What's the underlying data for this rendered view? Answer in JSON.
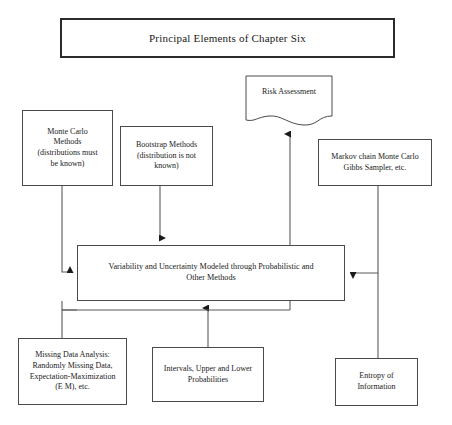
{
  "diagram": {
    "title_box": {
      "label": "Principal Elements of Chapter Six"
    },
    "nodes": {
      "risk": {
        "label": "Risk Assessment"
      },
      "monte_carlo": {
        "label": "Monte Carlo\nMethods\n(distributions must\nbe known)"
      },
      "bootstrap": {
        "label": "Bootstrap Methods\n(distribution is not\nknown)"
      },
      "markov": {
        "label": "Markov chain Monte Carlo\nGibbs Sampler, etc."
      },
      "central": {
        "label": "Variability and Uncertainty Modeled through Probabilistic and\nOther Methods"
      },
      "missing_data": {
        "label": "Missing Data Analysis:\nRandomly Missing Data,\nExpectation-Maximization\n(E M), etc."
      },
      "intervals": {
        "label": "Intervals, Upper and Lower\nProbabilities"
      },
      "entropy": {
        "label": "Entropy of\nInformation"
      }
    },
    "colors": {
      "stroke": "#4a4a4a",
      "title_stroke": "#2b2b2b",
      "connector": "#5a5a5a",
      "arrow": "#1a1a1a",
      "background": "#ffffff",
      "text": "#1a1a1a"
    }
  }
}
